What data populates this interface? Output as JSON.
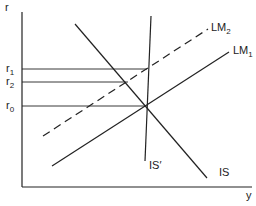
{
  "diagram": {
    "axes": {
      "y_label": "r",
      "x_label": "y"
    },
    "levels": [
      {
        "name": "r1",
        "base": "r",
        "sub": "1"
      },
      {
        "name": "r2",
        "base": "r",
        "sub": "2"
      },
      {
        "name": "r0",
        "base": "r",
        "sub": "0"
      }
    ],
    "curves": {
      "lm2": {
        "base": "LM",
        "sub": "2",
        "style": "dashed"
      },
      "lm1": {
        "base": "LM",
        "sub": "1",
        "style": "solid"
      },
      "is_prime": {
        "label": "IS′",
        "style": "solid"
      },
      "is": {
        "label": "IS",
        "style": "solid"
      }
    },
    "colors": {
      "line": "#222222",
      "background": "#ffffff"
    }
  }
}
